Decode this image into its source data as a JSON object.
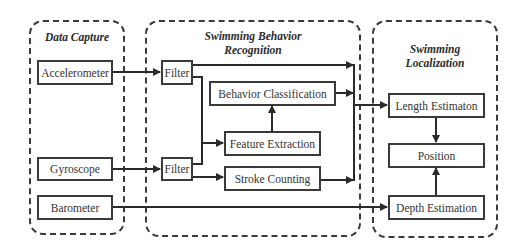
{
  "groups": {
    "data_capture": {
      "title": "Data Capture"
    },
    "behavior_recognition": {
      "title_line1": "Swimming Behavior",
      "title_line2": "Recognition"
    },
    "localization": {
      "title_line1": "Swimming",
      "title_line2": "Localization"
    }
  },
  "nodes": {
    "accelerometer": "Accelerometer",
    "gyroscope": "Gyroscope",
    "barometer": "Barometer",
    "filter_1": "Filter",
    "filter_2": "Filter",
    "behavior_classification": "Behavior Classification",
    "feature_extraction": "Feature Extraction",
    "stroke_counting": "Stroke Counting",
    "length_estimation": "Length Estimaton",
    "position": "Position",
    "depth_estimation": "Depth Estimation"
  },
  "edges": [
    {
      "from": "Accelerometer",
      "to": "Filter (1)"
    },
    {
      "from": "Gyroscope",
      "to": "Filter (2)"
    },
    {
      "from": "Filter (1)",
      "to": "Merge bus → Length Estimaton"
    },
    {
      "from": "Filter (1)",
      "to": "Feature Extraction"
    },
    {
      "from": "Filter (2)",
      "to": "Feature Extraction"
    },
    {
      "from": "Filter (2)",
      "to": "Stroke Counting"
    },
    {
      "from": "Feature Extraction",
      "to": "Behavior Classification"
    },
    {
      "from": "Behavior Classification",
      "to": "Merge bus → Length Estimaton"
    },
    {
      "from": "Stroke Counting",
      "to": "Merge bus → Length Estimaton"
    },
    {
      "from": "Length Estimaton",
      "to": "Position"
    },
    {
      "from": "Barometer",
      "to": "Depth Estimation"
    },
    {
      "from": "Depth Estimation",
      "to": "Position"
    }
  ],
  "colors": {
    "stroke": "#3a3a3a",
    "text": "#333333",
    "background": "#ffffff"
  }
}
